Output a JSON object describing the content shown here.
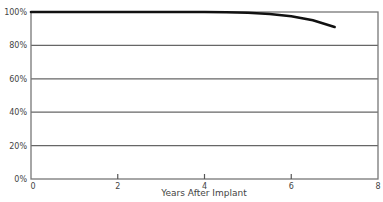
{
  "chart_data": {
    "type": "line",
    "title": "",
    "xlabel": "Years After Implant",
    "ylabel": "",
    "xlim": [
      0,
      8
    ],
    "ylim": [
      0,
      100
    ],
    "x_ticks": [
      "0",
      "2",
      "4",
      "6",
      "8"
    ],
    "y_ticks": [
      "0%",
      "20%",
      "40%",
      "60%",
      "80%",
      "100%"
    ],
    "grid": "horizontal",
    "legend": null,
    "series": [
      {
        "name": "Survival",
        "x": [
          0,
          1,
          2,
          3,
          4,
          4.5,
          5,
          5.5,
          6,
          6.5,
          7
        ],
        "y": [
          100,
          100,
          100,
          100,
          100,
          99.9,
          99.5,
          98.8,
          97.5,
          95,
          91
        ]
      }
    ]
  },
  "labels": {
    "xlabel": "Years After Implant",
    "yticks": [
      "100%",
      "80%",
      "60%",
      "40%",
      "20%",
      "0%"
    ],
    "xticks": [
      "0",
      "2",
      "4",
      "6",
      "8"
    ]
  }
}
